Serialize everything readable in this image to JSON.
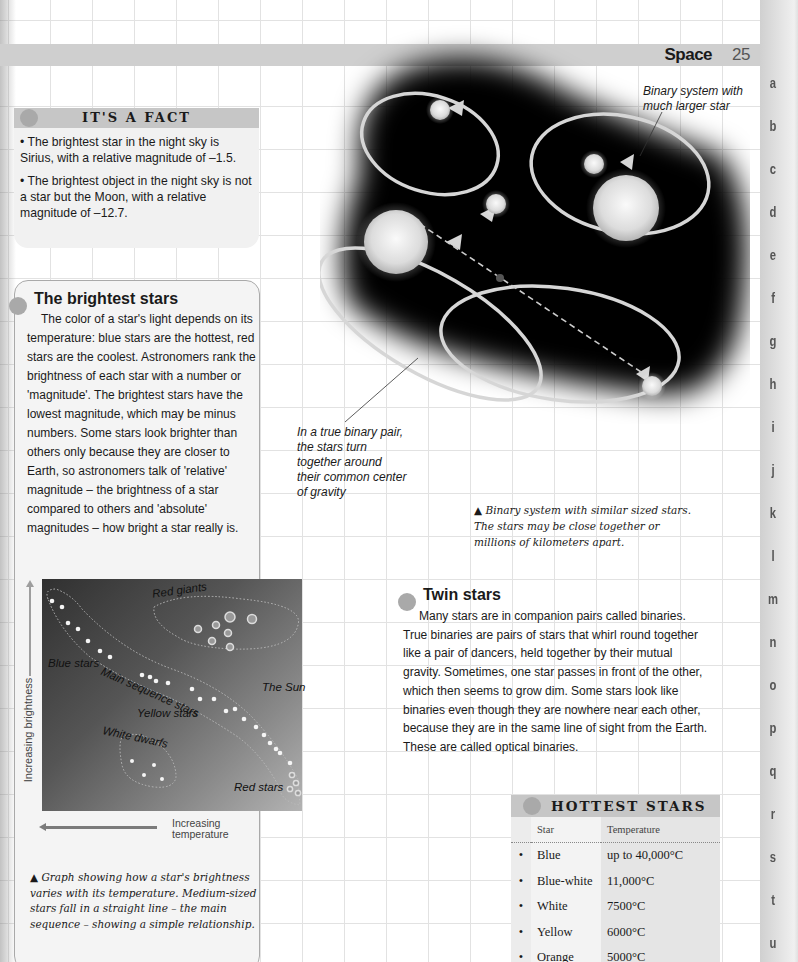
{
  "header": {
    "section": "Space",
    "page_number": "25"
  },
  "side_index": [
    "a",
    "b",
    "c",
    "d",
    "e",
    "f",
    "g",
    "h",
    "i",
    "j",
    "k",
    "l",
    "m",
    "n",
    "o",
    "p",
    "q",
    "r",
    "s",
    "t",
    "u"
  ],
  "fact_box": {
    "title": "IT'S A FACT",
    "items": [
      "• The brightest star in the night sky is Sirius, with a relative magnitude of –1.5.",
      "• The brightest object in the night sky is not a star but the Moon, with a relative magnitude of –12.7."
    ]
  },
  "brightest_stars": {
    "title": "The brightest stars",
    "body": "The color of a star's light depends on its temperature: blue stars are the hottest, red stars are the coolest. Astronomers rank the brightness of each star with a number or 'magnitude'. The brightest stars have the lowest magnitude, which may be minus numbers. Some stars look brighter than others only because they are closer to Earth, so astronomers talk of 'relative' magnitude – the brightness of a star compared to others and 'absolute' magnitudes – how bright a star really is."
  },
  "hr_diagram": {
    "y_axis_label": "Increasing brightness",
    "x_axis_label": "Increasing temperature",
    "regions": {
      "red_giants": "Red giants",
      "main_sequence": "Main sequence stars",
      "blue_stars": "Blue stars",
      "the_sun": "The Sun",
      "yellow_stars": "Yellow stars",
      "white_dwarfs": "White dwarfs",
      "red_stars": "Red stars"
    },
    "caption": "▲ Graph showing how a star's brightness varies with its temperature. Medium-sized stars fall in a straight line – the main sequence – showing a simple relationship."
  },
  "binary_illustration": {
    "callout_larger": "Binary system with much larger star",
    "callout_true_binary": "In a true binary pair, the stars turn together around their common center of gravity",
    "caption": "▲ Binary system with similar sized stars. The stars may be close together or millions of kilometers apart."
  },
  "twin_stars": {
    "title": "Twin stars",
    "body": "Many stars are in companion pairs called binaries. True binaries are pairs of stars that whirl round together like a pair of dancers, held together by their mutual gravity. Sometimes, one star passes in front of the other, which then seems to grow dim. Some stars look like binaries even though they are nowhere near each other, because they are in the same line of sight from the Earth. These are called optical binaries."
  },
  "hottest_stars": {
    "title": "HOTTEST STARS",
    "columns": [
      "Star",
      "Temperature"
    ],
    "rows": [
      {
        "bullet": "•",
        "star": "Blue",
        "temp": "up to 40,000°C"
      },
      {
        "bullet": "•",
        "star": "Blue-white",
        "temp": "11,000°C"
      },
      {
        "bullet": "•",
        "star": "White",
        "temp": "7500°C"
      },
      {
        "bullet": "•",
        "star": "Yellow",
        "temp": "6000°C"
      },
      {
        "bullet": "•",
        "star": "Orange",
        "temp": "5000°C"
      }
    ]
  }
}
